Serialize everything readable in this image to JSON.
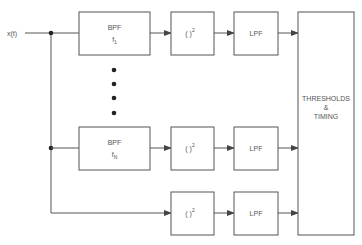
{
  "input": {
    "label": "x(t)"
  },
  "rows": [
    {
      "bpf": {
        "title": "BPF",
        "freq": "f",
        "freq_sub": "1"
      },
      "square": {
        "base": "( )",
        "exp": "2"
      },
      "lpf": "LPF"
    },
    {
      "bpf": {
        "title": "BPF",
        "freq": "f",
        "freq_sub": "N"
      },
      "square": {
        "base": "( )",
        "exp": "2"
      },
      "lpf": "LPF"
    },
    {
      "bpf": null,
      "square": {
        "base": "( )",
        "exp": "2"
      },
      "lpf": "LPF"
    }
  ],
  "decision": {
    "line1": "THRESHOLDS",
    "line2": "&",
    "line3": "TIMING"
  },
  "ellipsis_dots": 4,
  "colors": {
    "line": "#555555",
    "background": "#ffffff"
  }
}
